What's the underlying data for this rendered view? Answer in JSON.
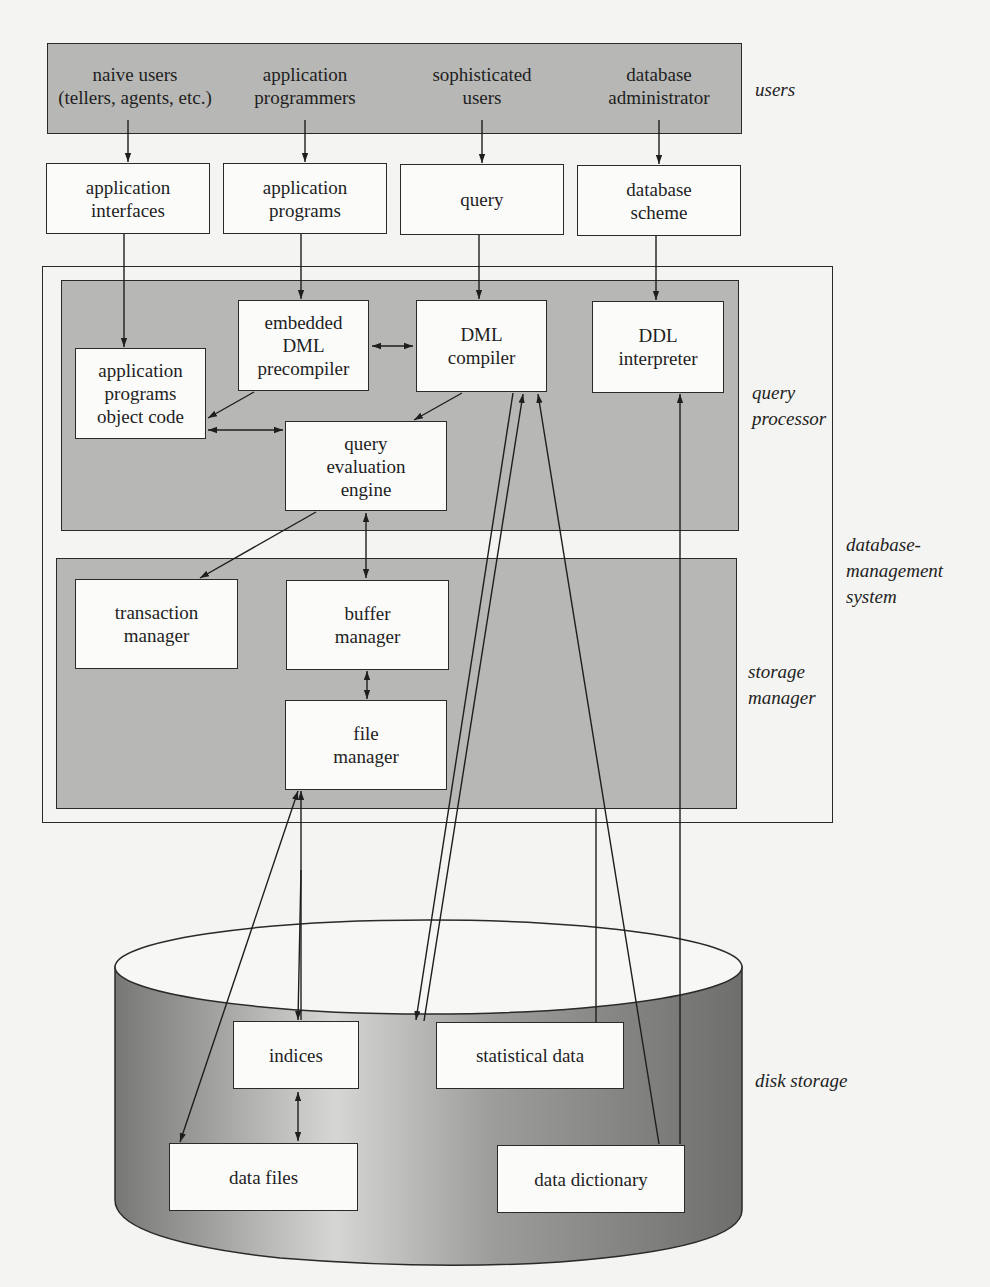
{
  "users_layer": {
    "label": "users",
    "groups": [
      {
        "line1": "naive users",
        "line2": "(tellers, agents, etc.)"
      },
      {
        "line1": "application",
        "line2": "programmers"
      },
      {
        "line1": "sophisticated",
        "line2": "users"
      },
      {
        "line1": "database",
        "line2": "administrator"
      }
    ]
  },
  "interfaces": [
    {
      "line1": "application",
      "line2": "interfaces"
    },
    {
      "line1": "application",
      "line2": "programs"
    },
    {
      "line1": "query",
      "line2": ""
    },
    {
      "line1": "database",
      "line2": "scheme"
    }
  ],
  "dbms": {
    "label_line1": "database-",
    "label_line2": "management",
    "label_line3": "system",
    "query_processor": {
      "label_line1": "query",
      "label_line2": "processor",
      "components": {
        "precompiler": {
          "line1": "embedded",
          "line2": "DML",
          "line3": "precompiler"
        },
        "dml_compiler": {
          "line1": "DML",
          "line2": "compiler"
        },
        "ddl_interpreter": {
          "line1": "DDL",
          "line2": "interpreter"
        },
        "object_code": {
          "line1": "application",
          "line2": "programs",
          "line3": "object code"
        },
        "eval_engine": {
          "line1": "query",
          "line2": "evaluation",
          "line3": "engine"
        }
      }
    },
    "storage_manager": {
      "label_line1": "storage",
      "label_line2": "manager",
      "components": {
        "transaction": {
          "line1": "transaction",
          "line2": "manager"
        },
        "buffer": {
          "line1": "buffer",
          "line2": "manager"
        },
        "file": {
          "line1": "file",
          "line2": "manager"
        }
      }
    }
  },
  "disk_storage": {
    "label": "disk storage",
    "components": {
      "indices": "indices",
      "statistical_data": "statistical data",
      "data_files": "data files",
      "data_dictionary": "data dictionary"
    }
  },
  "colors": {
    "shade": "#b7b7b5",
    "box_fill": "#fbfbfa",
    "stroke": "#2a2a2a",
    "background": "#f4f4f2",
    "cylinder_dark": "#7d7d7b",
    "cylinder_light": "#d6d6d4"
  }
}
